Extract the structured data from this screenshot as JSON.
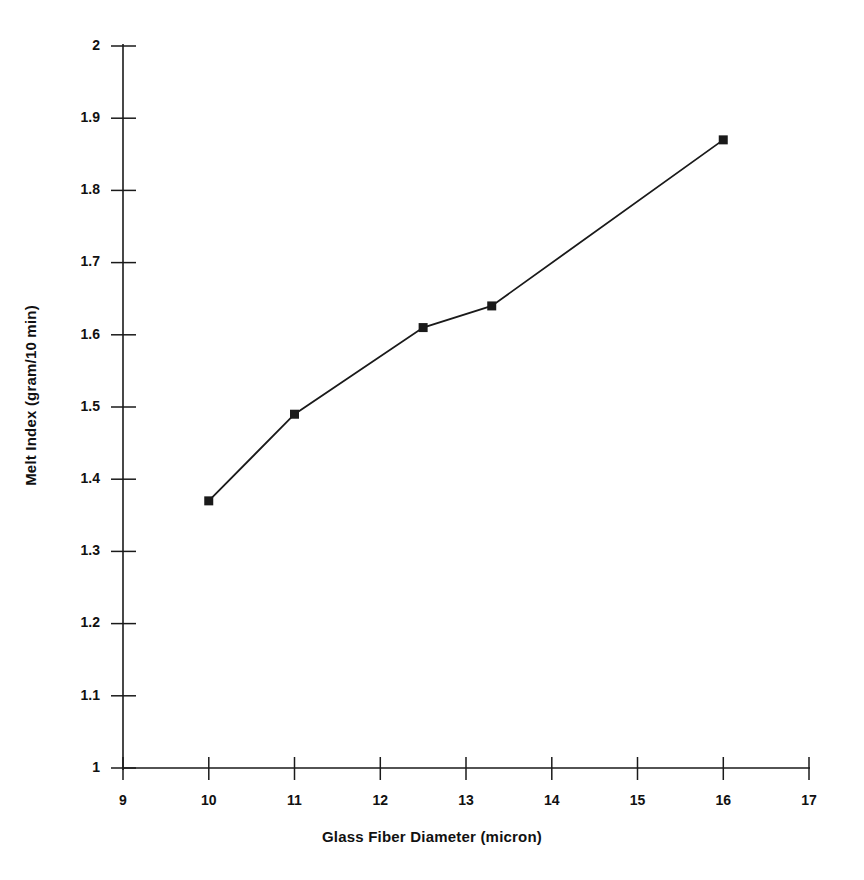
{
  "chart_data": {
    "type": "line",
    "title": "",
    "xlabel": "Glass Fiber Diameter (micron)",
    "ylabel": "Melt Index (gram/10 min)",
    "x": [
      10,
      11,
      12.5,
      13.3,
      16
    ],
    "values": [
      1.37,
      1.49,
      1.61,
      1.64,
      1.87
    ],
    "series": [
      {
        "name": "Melt Index",
        "x": [
          10,
          11,
          12.5,
          13.3,
          16
        ],
        "values": [
          1.37,
          1.49,
          1.61,
          1.64,
          1.87
        ]
      }
    ],
    "xlim": [
      9,
      17
    ],
    "ylim": [
      1,
      2
    ],
    "xticks": [
      9,
      10,
      11,
      12,
      13,
      14,
      15,
      16,
      17
    ],
    "yticks": [
      1,
      1.1,
      1.2,
      1.3,
      1.4,
      1.5,
      1.6,
      1.7,
      1.8,
      1.9,
      2
    ],
    "xtick_labels": [
      "9",
      "10",
      "11",
      "12",
      "13",
      "14",
      "15",
      "16",
      "17"
    ],
    "ytick_labels": [
      "1",
      "1.1",
      "1.2",
      "1.3",
      "1.4",
      "1.5",
      "1.6",
      "1.7",
      "1.8",
      "1.9",
      "2"
    ],
    "grid": false,
    "legend": false,
    "marker": "filled-square",
    "line_color": "#1a1a1a",
    "marker_color": "#1a1a1a",
    "background_color": "#ffffff"
  },
  "axis_titles": {
    "x": "Glass Fiber Diameter (micron)",
    "y": "Melt Index (gram/10 min)"
  },
  "ytick_labels": {
    "t0": "2",
    "t1": "1.9",
    "t2": "1.8",
    "t3": "1.7",
    "t4": "1.6",
    "t5": "1.5",
    "t6": "1.4",
    "t7": "1.3",
    "t8": "1.2",
    "t9": "1.1",
    "t10": "1"
  },
  "xtick_labels": {
    "t0": "9",
    "t1": "10",
    "t2": "11",
    "t3": "12",
    "t4": "13",
    "t5": "14",
    "t6": "15",
    "t7": "16",
    "t8": "17"
  }
}
